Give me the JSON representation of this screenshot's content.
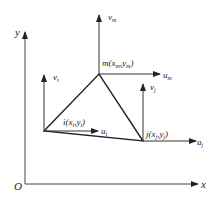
{
  "diagram": {
    "axes": {
      "origin_label": "O",
      "x_label": "x",
      "y_label": "y"
    },
    "nodes": [
      {
        "id": "i",
        "label": "i(x",
        "sub1": "i",
        "mid": ",y",
        "sub2": "i",
        "end": ")",
        "u_base": "u",
        "u_sub": "i",
        "v_base": "v",
        "v_sub": "i"
      },
      {
        "id": "j",
        "label": "j(x",
        "sub1": "j",
        "mid": ",y",
        "sub2": "j",
        "end": ")",
        "u_base": "u",
        "u_sub": "j",
        "v_base": "v",
        "v_sub": "j"
      },
      {
        "id": "m",
        "label": "m(x",
        "sub1": "m",
        "mid": ",y",
        "sub2": "m",
        "end": ")",
        "u_base": "u",
        "u_sub": "m",
        "v_base": "v",
        "v_sub": "m"
      }
    ],
    "colors": {
      "line": "#222222",
      "axis": "#444444"
    }
  }
}
